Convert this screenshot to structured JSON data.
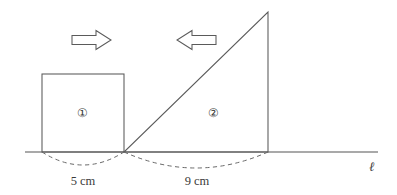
{
  "figure": {
    "canvas": {
      "width": 397,
      "height": 195
    },
    "background_color": "#ffffff",
    "stroke_color": "#5a5a5a",
    "text_color": "#3a3a3a"
  },
  "baseline": {
    "label": "ℓ",
    "label_x": 372,
    "label_y": 166,
    "y": 152,
    "x_start": 25,
    "x_end": 378
  },
  "shapes": [
    {
      "id": "square-1",
      "kind": "square",
      "region_label": "①",
      "region_label_x": 82,
      "region_label_y": 113,
      "x_left": 42,
      "x_right": 124,
      "y_top": 74,
      "y_bottom": 152,
      "side_length_cm": 5,
      "dimension_label": "5 cm",
      "dimension_label_x": 83,
      "dimension_label_y": 185
    },
    {
      "id": "triangle-2",
      "kind": "right-triangle",
      "region_label": "②",
      "region_label_x": 213,
      "region_label_y": 113,
      "vertex_base_left_x": 124,
      "vertex_base_left_y": 152,
      "vertex_base_right_x": 268,
      "vertex_base_right_y": 152,
      "vertex_apex_x": 268,
      "vertex_apex_y": 12,
      "base_length_cm": 9,
      "dimension_label": "9 cm",
      "dimension_label_x": 197,
      "dimension_label_y": 185
    }
  ],
  "arrows": [
    {
      "id": "arrow-right",
      "direction": "right",
      "name": "right-arrow",
      "x_start": 72,
      "x_end": 111,
      "y_center": 40,
      "shaft_half_height": 4.5,
      "head_half_height": 9.5,
      "head_length": 15
    },
    {
      "id": "arrow-left",
      "direction": "left",
      "name": "left-arrow",
      "x_start": 216,
      "x_end": 177,
      "y_center": 40,
      "shaft_half_height": 4.5,
      "head_half_height": 9.5,
      "head_length": 15
    }
  ],
  "dimension_arcs": [
    {
      "id": "arc-5cm",
      "from_x": 42,
      "to_x": 124,
      "baseline_y": 152,
      "dip": 13
    },
    {
      "id": "arc-9cm",
      "from_x": 124,
      "to_x": 268,
      "baseline_y": 152,
      "dip": 16
    }
  ]
}
